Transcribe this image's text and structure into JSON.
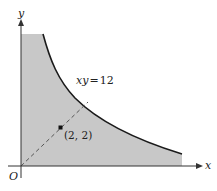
{
  "diagram": {
    "axes": {
      "x_label": "x",
      "y_label": "y",
      "origin_label": "O"
    },
    "curve": {
      "equation_label_lhs": "xy",
      "equation_label_eq": "=",
      "equation_label_rhs": "12",
      "equation": "xy = 12"
    },
    "point": {
      "label": "(2, 2)",
      "x": 2,
      "y": 2
    },
    "colors": {
      "shade": "#c8c8c8",
      "curve": "#1a1a1a",
      "axis": "#333333",
      "dashed": "#555555"
    }
  }
}
